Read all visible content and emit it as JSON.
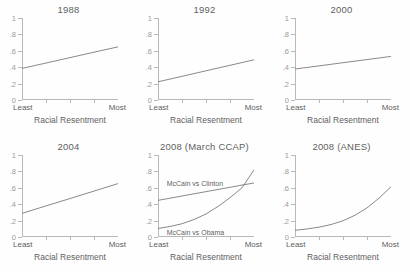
{
  "figure": {
    "background": "#fefefe",
    "line_color": "#7c7c7c",
    "axis_color": "#b9b9b9",
    "text_color": "#5f5f5f"
  },
  "axes": {
    "ylabels": [
      "1",
      ".8",
      ".6",
      ".4",
      ".2",
      "0"
    ],
    "yvalues": [
      1,
      0.8,
      0.6,
      0.4,
      0.2,
      0
    ],
    "ylim": [
      0,
      1
    ],
    "xlabel": "Racial Resentment",
    "x_low": "Least",
    "x_high": "Most",
    "xlim": [
      0,
      1
    ],
    "xticks": [
      0,
      0.25,
      0.5,
      0.75,
      1
    ],
    "grid": false
  },
  "chart_data": [
    {
      "type": "line",
      "title": "1988",
      "xlabel": "Racial Resentment",
      "ylabel": "",
      "xlim": [
        0,
        1
      ],
      "ylim": [
        0,
        1
      ],
      "x": [
        0,
        0.25,
        0.5,
        0.75,
        1
      ],
      "series": [
        {
          "name": "1988",
          "values": [
            0.385,
            0.451,
            0.517,
            0.583,
            0.648
          ]
        }
      ]
    },
    {
      "type": "line",
      "title": "1992",
      "xlabel": "Racial Resentment",
      "ylabel": "",
      "xlim": [
        0,
        1
      ],
      "ylim": [
        0,
        1
      ],
      "x": [
        0,
        0.25,
        0.5,
        0.75,
        1
      ],
      "series": [
        {
          "name": "1992",
          "values": [
            0.222,
            0.289,
            0.356,
            0.423,
            0.49
          ]
        }
      ]
    },
    {
      "type": "line",
      "title": "2000",
      "xlabel": "Racial Resentment",
      "ylabel": "",
      "xlim": [
        0,
        1
      ],
      "ylim": [
        0,
        1
      ],
      "x": [
        0,
        0.25,
        0.5,
        0.75,
        1
      ],
      "series": [
        {
          "name": "2000",
          "values": [
            0.378,
            0.416,
            0.455,
            0.493,
            0.532
          ]
        }
      ]
    },
    {
      "type": "line",
      "title": "2004",
      "xlabel": "Racial Resentment",
      "ylabel": "",
      "xlim": [
        0,
        1
      ],
      "ylim": [
        0,
        1
      ],
      "x": [
        0,
        0.25,
        0.5,
        0.75,
        1
      ],
      "series": [
        {
          "name": "2004",
          "values": [
            0.288,
            0.379,
            0.469,
            0.56,
            0.651
          ]
        }
      ]
    },
    {
      "type": "line",
      "title": "2008 (March CCAP)",
      "xlabel": "Racial Resentment",
      "ylabel": "",
      "xlim": [
        0,
        1
      ],
      "ylim": [
        0,
        1
      ],
      "x": [
        0,
        0.125,
        0.25,
        0.375,
        0.5,
        0.625,
        0.75,
        0.875,
        1
      ],
      "series": [
        {
          "name": "McCain vs Clinton",
          "values": [
            0.447,
            0.473,
            0.5,
            0.527,
            0.553,
            0.58,
            0.606,
            0.633,
            0.659
          ]
        },
        {
          "name": "McCain vs Obama",
          "values": [
            0.104,
            0.128,
            0.162,
            0.213,
            0.281,
            0.372,
            0.48,
            0.6,
            0.818
          ]
        }
      ],
      "annotations": [
        {
          "text": "McCain vs Clinton",
          "x": 0.09,
          "y": 0.645
        },
        {
          "text": "McCain vs Obama",
          "x": 0.09,
          "y": 0.045
        }
      ]
    },
    {
      "type": "line",
      "title": "2008 (ANES)",
      "xlabel": "Racial Resentment",
      "ylabel": "",
      "xlim": [
        0,
        1
      ],
      "ylim": [
        0,
        1
      ],
      "x": [
        0,
        0.125,
        0.25,
        0.375,
        0.5,
        0.625,
        0.75,
        0.875,
        1
      ],
      "series": [
        {
          "name": "2008 (ANES)",
          "values": [
            0.082,
            0.098,
            0.12,
            0.152,
            0.198,
            0.265,
            0.355,
            0.474,
            0.612
          ]
        }
      ]
    }
  ]
}
